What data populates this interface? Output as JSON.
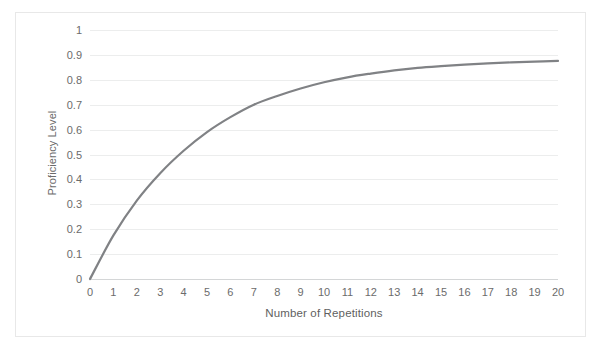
{
  "chart_data": {
    "type": "line",
    "title": "",
    "xlabel": "Number of Repetitions",
    "ylabel": "Proficiency Level",
    "xlim": [
      0,
      20
    ],
    "ylim": [
      0,
      1
    ],
    "grid": true,
    "legend": null,
    "legend_position": "none",
    "line_color": "#808285",
    "grid_color": "#ECEDED",
    "text_color": "#6B6B6B",
    "x_ticks": [
      "0",
      "1",
      "2",
      "3",
      "4",
      "5",
      "6",
      "7",
      "8",
      "9",
      "10",
      "11",
      "12",
      "13",
      "14",
      "15",
      "16",
      "17",
      "18",
      "19",
      "20"
    ],
    "y_ticks": [
      "0",
      "0.1",
      "0.2",
      "0.3",
      "0.4",
      "0.5",
      "0.6",
      "0.7",
      "0.8",
      "0.9",
      "1"
    ],
    "x": [
      0,
      1,
      2,
      3,
      4,
      5,
      6,
      7,
      8,
      9,
      10,
      11,
      12,
      13,
      14,
      15,
      16,
      17,
      18,
      19,
      20
    ],
    "series": [
      {
        "name": "Proficiency",
        "values": [
          0,
          0.175,
          0.315,
          0.425,
          0.515,
          0.59,
          0.65,
          0.7,
          0.735,
          0.765,
          0.79,
          0.81,
          0.825,
          0.838,
          0.848,
          0.855,
          0.861,
          0.866,
          0.87,
          0.873,
          0.876
        ]
      }
    ]
  }
}
